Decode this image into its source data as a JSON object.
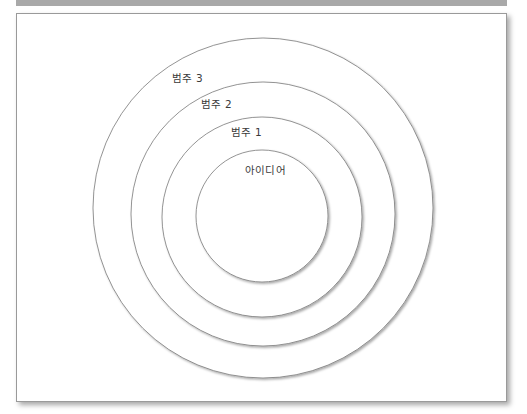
{
  "diagram": {
    "type": "concentric-circles",
    "colors": {
      "header_bar": "#a9a9a9",
      "circle_stroke": "#7a7a7a",
      "text": "#3a3a3a",
      "background": "#ffffff"
    },
    "rings": [
      {
        "id": "ring-category-3",
        "label": "범주 3",
        "cx": 263,
        "cy": 208,
        "r": 170
      },
      {
        "id": "ring-category-2",
        "label": "범주 2",
        "cx": 263,
        "cy": 214,
        "r": 132
      },
      {
        "id": "ring-category-1",
        "label": "범주 1",
        "cx": 262,
        "cy": 217,
        "r": 100
      },
      {
        "id": "ring-idea",
        "label": "아이디어",
        "cx": 262,
        "cy": 216,
        "r": 66
      }
    ]
  }
}
